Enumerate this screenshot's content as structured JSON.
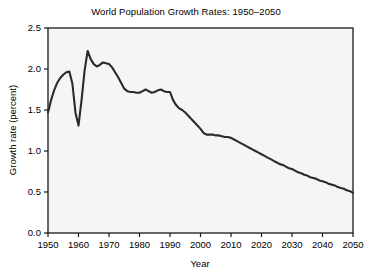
{
  "chart_data": {
    "type": "line",
    "title": "World Population Growth Rates: 1950–2050",
    "xlabel": "Year",
    "ylabel": "Growth rate (percent)",
    "xlim": [
      1950,
      2050
    ],
    "ylim": [
      0.0,
      2.5
    ],
    "grid": false,
    "legend": "none",
    "xticks": [
      1950,
      1960,
      1970,
      1980,
      1990,
      2000,
      2010,
      2020,
      2030,
      2040,
      2050
    ],
    "xtick_labels": [
      "1950",
      "1960",
      "1970",
      "1980",
      "1990",
      "2000",
      "2010",
      "2020",
      "2030",
      "2040",
      "2050"
    ],
    "yticks": [
      0.0,
      0.5,
      1.0,
      1.5,
      2.0,
      2.5
    ],
    "ytick_labels": [
      "0.0",
      "0.5",
      "1.0",
      "1.5",
      "2.0",
      "2.5"
    ],
    "line_color": "#2b2b2b",
    "plot_background": "#f5f5f5",
    "figure_background": "#ffffff",
    "series": [
      {
        "name": "World population growth rate",
        "x": [
          1950,
          1951,
          1952,
          1953,
          1954,
          1955,
          1956,
          1957,
          1958,
          1959,
          1960,
          1961,
          1962,
          1963,
          1964,
          1965,
          1966,
          1967,
          1968,
          1969,
          1970,
          1971,
          1972,
          1973,
          1974,
          1975,
          1976,
          1977,
          1978,
          1979,
          1980,
          1981,
          1982,
          1983,
          1984,
          1985,
          1986,
          1987,
          1988,
          1989,
          1990,
          1991,
          1992,
          1993,
          1994,
          1995,
          1996,
          1997,
          1998,
          1999,
          2000,
          2001,
          2002,
          2003,
          2004,
          2005,
          2006,
          2007,
          2008,
          2009,
          2010,
          2011,
          2012,
          2013,
          2014,
          2015,
          2016,
          2017,
          2018,
          2019,
          2020,
          2021,
          2022,
          2023,
          2024,
          2025,
          2026,
          2027,
          2028,
          2029,
          2030,
          2031,
          2032,
          2033,
          2034,
          2035,
          2036,
          2037,
          2038,
          2039,
          2040,
          2041,
          2042,
          2043,
          2044,
          2045,
          2046,
          2047,
          2048,
          2049,
          2050
        ],
        "y": [
          1.47,
          1.62,
          1.74,
          1.83,
          1.89,
          1.93,
          1.96,
          1.97,
          1.82,
          1.47,
          1.31,
          1.62,
          1.98,
          2.22,
          2.12,
          2.06,
          2.03,
          2.05,
          2.08,
          2.07,
          2.06,
          2.02,
          1.96,
          1.9,
          1.83,
          1.76,
          1.73,
          1.72,
          1.72,
          1.71,
          1.71,
          1.73,
          1.75,
          1.73,
          1.71,
          1.72,
          1.74,
          1.75,
          1.73,
          1.72,
          1.72,
          1.62,
          1.56,
          1.52,
          1.5,
          1.47,
          1.43,
          1.39,
          1.35,
          1.31,
          1.27,
          1.22,
          1.2,
          1.2,
          1.2,
          1.19,
          1.19,
          1.18,
          1.17,
          1.17,
          1.16,
          1.14,
          1.12,
          1.1,
          1.08,
          1.06,
          1.04,
          1.02,
          1.0,
          0.98,
          0.96,
          0.94,
          0.92,
          0.9,
          0.88,
          0.86,
          0.84,
          0.83,
          0.81,
          0.79,
          0.78,
          0.76,
          0.74,
          0.73,
          0.71,
          0.7,
          0.68,
          0.67,
          0.66,
          0.64,
          0.63,
          0.62,
          0.6,
          0.59,
          0.58,
          0.56,
          0.55,
          0.54,
          0.52,
          0.51,
          0.49
        ]
      }
    ]
  }
}
